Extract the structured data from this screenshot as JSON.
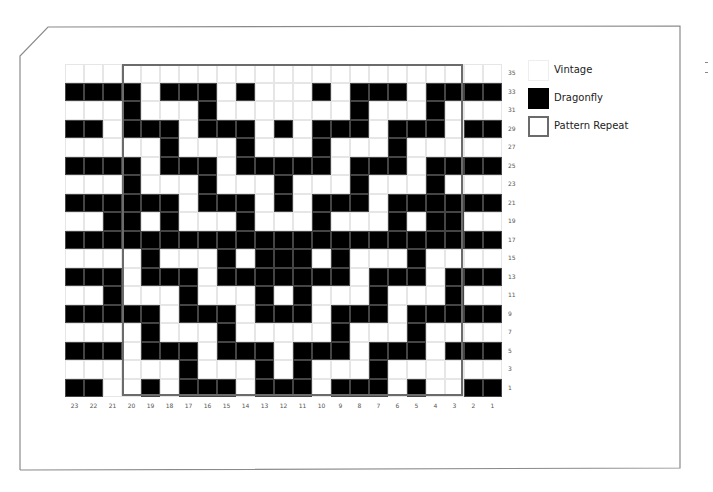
{
  "legend": {
    "items": [
      {
        "label": "Vintage",
        "swatch": "white",
        "color": "#ffffff"
      },
      {
        "label": "Dragonfly",
        "swatch": "black",
        "color": "#000000"
      },
      {
        "label": "Pattern Repeat",
        "swatch": "outline",
        "color": "#6b6b6b"
      }
    ]
  },
  "chart": {
    "columns": 23,
    "rows": 18,
    "column_labels": [
      "23",
      "22",
      "21",
      "20",
      "19",
      "18",
      "17",
      "16",
      "15",
      "14",
      "13",
      "12",
      "11",
      "10",
      "9",
      "8",
      "7",
      "6",
      "5",
      "4",
      "3",
      "2",
      "1"
    ],
    "row_labels": [
      "35",
      "33",
      "31",
      "29",
      "27",
      "25",
      "23",
      "21",
      "19",
      "17",
      "15",
      "13",
      "11",
      "9",
      "7",
      "5",
      "3",
      "1"
    ],
    "pattern_repeat": {
      "from_column": "20",
      "to_column": "3",
      "from_row": "35",
      "to_row": "1"
    },
    "grid": [
      "00000000000000000000000",
      "11110111010001011101111",
      "00010001000000010001000",
      "11011101110101110111011",
      "00000100010001000100000",
      "11110111011111011101111",
      "00010001000100010001000",
      "11111101110101110111111",
      "00110100010001000101100",
      "11111111111111111111111",
      "00001000101110100010000",
      "11101110111111101110111",
      "00100010001010001000100",
      "11111011101110111011111",
      "00001000100000100010000",
      "11101110111011101110111",
      "00000010001010001000000",
      "11001011101110111010011"
    ]
  }
}
